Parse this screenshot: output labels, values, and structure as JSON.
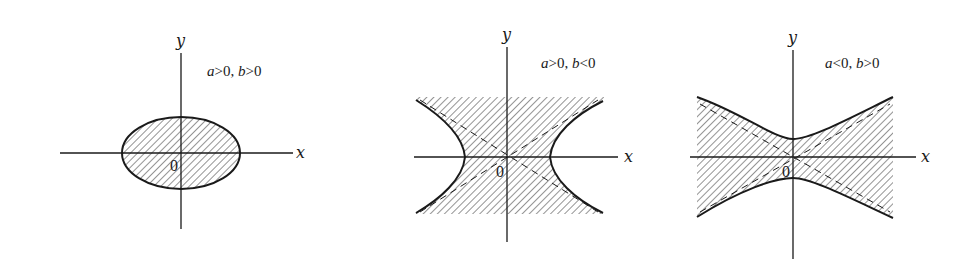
{
  "colors": {
    "ink": "#1a1a1a",
    "hatch": "#3a3a3a",
    "background": "#ffffff"
  },
  "axis_labels": {
    "x": "x",
    "y": "y",
    "origin": "0"
  },
  "panels": [
    {
      "id": "ellipse",
      "shape": "ellipse",
      "condition": "a>0, b>0",
      "condition_parts": {
        "a": "a",
        "op_a": ">0, ",
        "b": "b",
        "op_b": ">0"
      },
      "shaded_region": "interior of ellipse"
    },
    {
      "id": "hyperbola-horizontal",
      "shape": "hyperbola opening left/right",
      "condition": "a>0, b<0",
      "condition_parts": {
        "a": "a",
        "op_a": ">0, ",
        "b": "b",
        "op_b": "<0"
      },
      "shaded_region": "region between the two branches, with dashed asymptotes"
    },
    {
      "id": "hyperbola-vertical",
      "shape": "hyperbola opening up/down",
      "condition": "a<0, b>0",
      "condition_parts": {
        "a": "a",
        "op_a": "<0, ",
        "b": "b",
        "op_b": ">0"
      },
      "shaded_region": "region between the two branches, with dashed asymptotes"
    }
  ]
}
